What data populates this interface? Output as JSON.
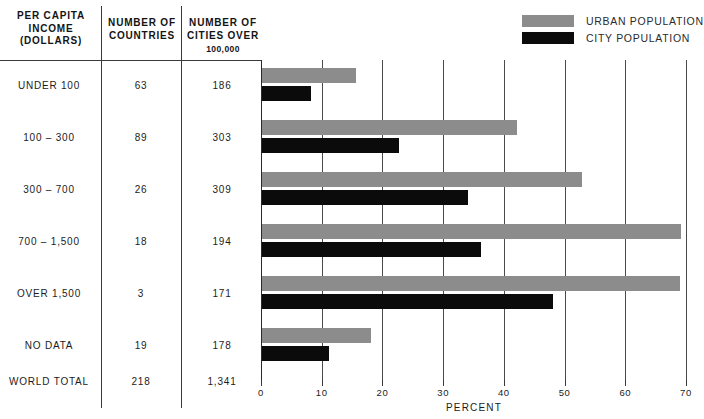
{
  "legend": {
    "items": [
      {
        "label": "URBAN POPULATION",
        "color": "#8c8c8c",
        "name": "urban-population"
      },
      {
        "label": "CITY POPULATION",
        "color": "#0b0b0b",
        "name": "city-population"
      }
    ]
  },
  "table": {
    "headers": {
      "col1_line1": "PER CAPITA",
      "col1_line2": "INCOME",
      "col1_line3": "(DOLLARS)",
      "col2_line1": "NUMBER OF",
      "col2_line2": "COUNTRIES",
      "col3_line1": "NUMBER OF",
      "col3_line2": "CITIES OVER",
      "col3_sub": "100,000"
    },
    "rows": [
      {
        "label": "UNDER 100",
        "countries": "63",
        "cities": "186"
      },
      {
        "label": "100 – 300",
        "countries": "89",
        "cities": "303"
      },
      {
        "label": "300 – 700",
        "countries": "26",
        "cities": "309"
      },
      {
        "label": "700 – 1,500",
        "countries": "18",
        "cities": "194"
      },
      {
        "label": "OVER 1,500",
        "countries": "3",
        "cities": "171"
      },
      {
        "label": "NO DATA",
        "countries": "19",
        "cities": "178"
      },
      {
        "label": "WORLD TOTAL",
        "countries": "218",
        "cities": "1,341"
      }
    ]
  },
  "chart_data": {
    "type": "bar",
    "orientation": "horizontal",
    "title": "",
    "xlabel": "PERCENT",
    "ylabel": "",
    "xlim": [
      0,
      70
    ],
    "xticks": [
      0,
      10,
      20,
      30,
      40,
      50,
      60,
      70
    ],
    "grid": true,
    "legend_position": "top-right",
    "categories": [
      "UNDER 100",
      "100 – 300",
      "300 – 700",
      "700 – 1,500",
      "OVER 1,500",
      "NO DATA",
      "WORLD TOTAL"
    ],
    "series": [
      {
        "name": "URBAN POPULATION",
        "color": "#8c8c8c",
        "values": [
          15.4,
          42.0,
          52.7,
          69.0,
          68.8,
          18.0,
          null
        ]
      },
      {
        "name": "CITY POPULATION",
        "color": "#0b0b0b",
        "values": [
          8.0,
          22.5,
          34.0,
          36.0,
          48.0,
          11.0,
          null
        ]
      }
    ]
  }
}
